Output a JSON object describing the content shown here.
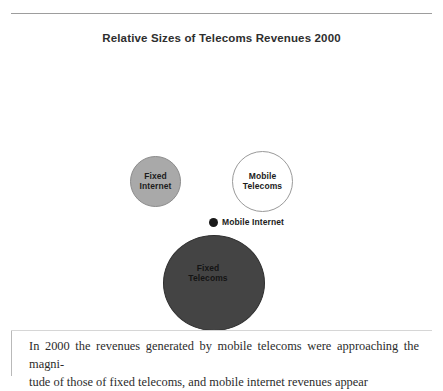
{
  "figure": {
    "title": "Relative Sizes of Telecoms Revenues 2000",
    "caption_line_1": "In 2000 the revenues generated by mobile telecoms were approaching the magni-",
    "caption_line_2": "tude of those of fixed telecoms, and mobile internet revenues appear"
  },
  "chart_data": {
    "type": "bubble",
    "title": "Relative Sizes of Telecoms Revenues 2000",
    "xlabel": "",
    "ylabel": "",
    "grid": false,
    "legend": "none",
    "note": "Area-proportional bubbles comparing relative revenue size of four telecoms segments in 2000. No numeric axis is shown; size is the only encoded quantity.",
    "categories": [
      "Fixed Internet",
      "Mobile Telecoms",
      "Mobile Internet",
      "Fixed Telecoms"
    ],
    "points": [
      {
        "label": "Fixed Internet",
        "label_lines": [
          "Fixed",
          "Internet"
        ],
        "diameter_px": 51,
        "relative_area": 0.25,
        "fill": "#a9a9a9",
        "stroke": "#8b8b8b",
        "label_color": "#1c1c1c",
        "label_placement": "inside"
      },
      {
        "label": "Mobile Telecoms",
        "label_lines": [
          "Mobile",
          "Telecoms"
        ],
        "diameter_px": 61,
        "relative_area": 0.36,
        "fill": "#ffffff",
        "stroke": "#9a9a9a",
        "label_color": "#1c1c1c",
        "label_placement": "inside"
      },
      {
        "label": "Mobile Internet",
        "label_lines": [
          "Mobile Internet"
        ],
        "diameter_px": 9,
        "relative_area": 0.008,
        "fill": "#1a1a1a",
        "stroke": "#1a1a1a",
        "label_color": "#1c1c1c",
        "label_placement": "outside-right"
      },
      {
        "label": "Fixed Telecoms",
        "label_lines": [
          "Fixed",
          "Telecoms"
        ],
        "diameter_px": 99,
        "relative_area": 1.0,
        "fill": "#444444",
        "stroke": "#2f2f2f",
        "label_color": "#141414",
        "label_placement": "inside"
      }
    ]
  }
}
